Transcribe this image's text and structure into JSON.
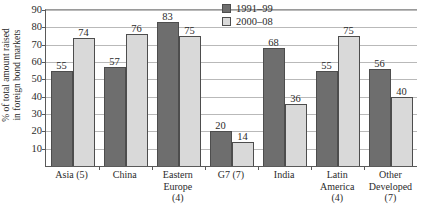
{
  "chart_data": {
    "type": "bar",
    "title": "",
    "xlabel": "",
    "ylabel": "% of total amount raised in foreign bond markets",
    "ylabel_lines": [
      "% of total amount raised",
      "in foreign bond markets"
    ],
    "ylim": [
      0,
      90
    ],
    "ytick_step": 10,
    "yticks": [
      10,
      20,
      30,
      40,
      50,
      60,
      70,
      80,
      90
    ],
    "ytick_labels": [
      "10",
      "20",
      "30",
      "40",
      "50",
      "60",
      "70",
      "80",
      "90"
    ],
    "grid": true,
    "legend_position": "top-right",
    "categories": [
      "Asia (5)",
      "China",
      "Eastern Europe (4)",
      "G7 (7)",
      "India",
      "Latin America (4)",
      "Other Developed (7)"
    ],
    "category_lines": [
      [
        "Asia (5)"
      ],
      [
        "China"
      ],
      [
        "Eastern",
        "Europe",
        "(4)"
      ],
      [
        "G7 (7)"
      ],
      [
        "India"
      ],
      [
        "Latin",
        "America",
        "(4)"
      ],
      [
        "Other",
        "Developed",
        "(7)"
      ]
    ],
    "series": [
      {
        "name": "1991–99",
        "color": "#6e6e6e",
        "values": [
          55,
          57,
          83,
          20,
          68,
          55,
          56
        ]
      },
      {
        "name": "2000–08",
        "color": "#d9d9d9",
        "values": [
          74,
          76,
          75,
          14,
          36,
          75,
          40
        ]
      }
    ]
  },
  "legend": {
    "items": [
      {
        "label": "1991–99"
      },
      {
        "label": "2000–08"
      }
    ]
  }
}
